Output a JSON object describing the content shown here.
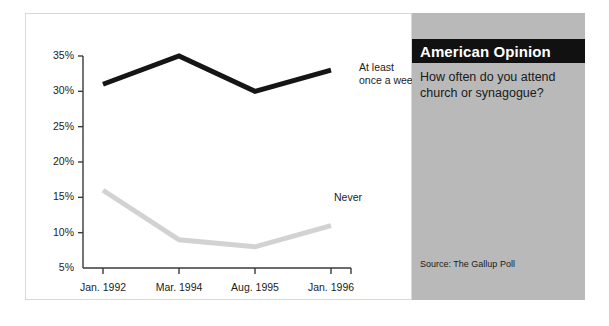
{
  "panel": {
    "title": "American Opinion",
    "question_lines": [
      "How often do you attend",
      "church or synagogue?"
    ],
    "source": "Source: The Gallup Poll",
    "banner_bg": "#111111",
    "banner_fg": "#ffffff",
    "panel_bg": "#b9b9b9"
  },
  "chart_data": {
    "type": "line",
    "title": "American Opinion",
    "subtitle": "How often do you attend church or synagogue?",
    "xlabel": "",
    "ylabel": "",
    "categories": [
      "Jan. 1992",
      "Mar. 1994",
      "Aug. 1995",
      "Jan. 1996"
    ],
    "series": [
      {
        "name": "At least once a week",
        "label_lines": [
          "At  least",
          "once a week"
        ],
        "color": "#151515",
        "values": [
          31,
          35,
          30,
          33
        ]
      },
      {
        "name": "Never",
        "label_lines": [
          "Never"
        ],
        "color": "#d2d2d2",
        "values": [
          16,
          9,
          8,
          11
        ]
      }
    ],
    "ylim": [
      5,
      35
    ],
    "yticks": [
      5,
      10,
      15,
      20,
      25,
      30,
      35
    ],
    "ytick_labels": [
      "5%",
      "10%",
      "15%",
      "20%",
      "25%",
      "30%",
      "35%"
    ],
    "grid": false,
    "legend": "inline-annotations",
    "axis_color": "#3a3a3a",
    "value_suffix": "%"
  }
}
